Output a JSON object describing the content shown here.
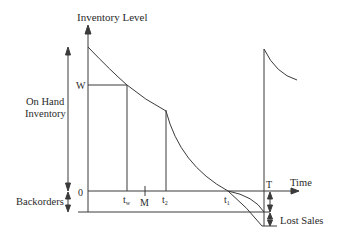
{
  "diagram": {
    "type": "inventory-level-over-time",
    "colors": {
      "line": "#3a3a3a",
      "background": "#ffffff",
      "text": "#2a2a2a"
    },
    "labels": {
      "y_axis_title": "Inventory Level",
      "x_axis_title": "Time",
      "on_hand_line1": "On Hand",
      "on_hand_line2": "Inventory",
      "backorders": "Backorders",
      "lost_sales": "Lost Sales",
      "w_level": "W",
      "zero_level": "0",
      "t_w": "t",
      "t_w_sub": "w",
      "m": "M",
      "t_2": "t",
      "t_2_sub": "2",
      "t_1": "t",
      "t_1_sub": "1",
      "t_end": "T"
    }
  }
}
